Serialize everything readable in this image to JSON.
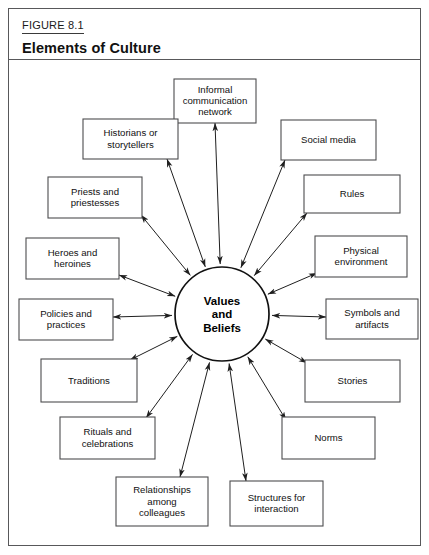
{
  "figure": {
    "label": "FIGURE 8.1",
    "title": "Elements of Culture"
  },
  "diagram": {
    "type": "radial-hub-and-spoke",
    "center": {
      "name": "values-and-beliefs",
      "lines": [
        "Values",
        "and",
        "Beliefs"
      ],
      "text": "Values and Beliefs"
    },
    "arrow_style": "double-headed",
    "colors": {
      "frame": "#58585a",
      "box_stroke": "#4d4d4f",
      "line": "#1f1f1f",
      "text": "#111111",
      "background": "#ffffff"
    },
    "nodes": [
      {
        "id": "informal-communication-network",
        "lines": [
          "Informal",
          "communication",
          "network"
        ],
        "text": "Informal communication network"
      },
      {
        "id": "social-media",
        "lines": [
          "Social media"
        ],
        "text": "Social media"
      },
      {
        "id": "rules",
        "lines": [
          "Rules"
        ],
        "text": "Rules"
      },
      {
        "id": "physical-environment",
        "lines": [
          "Physical",
          "environment"
        ],
        "text": "Physical environment"
      },
      {
        "id": "symbols-and-artifacts",
        "lines": [
          "Symbols and",
          "artifacts"
        ],
        "text": "Symbols and artifacts"
      },
      {
        "id": "stories",
        "lines": [
          "Stories"
        ],
        "text": "Stories"
      },
      {
        "id": "norms",
        "lines": [
          "Norms"
        ],
        "text": "Norms"
      },
      {
        "id": "structures-for-interaction",
        "lines": [
          "Structures for",
          "interaction"
        ],
        "text": "Structures for interaction"
      },
      {
        "id": "relationships-among-colleagues",
        "lines": [
          "Relationships",
          "among",
          "colleagues"
        ],
        "text": "Relationships among colleagues"
      },
      {
        "id": "rituals-and-celebrations",
        "lines": [
          "Rituals and",
          "celebrations"
        ],
        "text": "Rituals and celebrations"
      },
      {
        "id": "traditions",
        "lines": [
          "Traditions"
        ],
        "text": "Traditions"
      },
      {
        "id": "policies-and-practices",
        "lines": [
          "Policies and",
          "practices"
        ],
        "text": "Policies and practices"
      },
      {
        "id": "heroes-and-heroines",
        "lines": [
          "Heroes and",
          "heroines"
        ],
        "text": "Heroes and heroines"
      },
      {
        "id": "priests-and-priestesses",
        "lines": [
          "Priests and",
          "priestesses"
        ],
        "text": "Priests and priestesses"
      },
      {
        "id": "historians-or-storytellers",
        "lines": [
          "Historians or",
          "storytellers"
        ],
        "text": "Historians or storytellers"
      }
    ]
  }
}
